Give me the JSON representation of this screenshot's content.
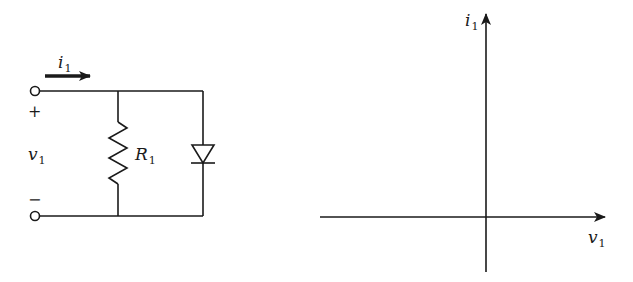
{
  "circuit": {
    "current_label": {
      "sym": "i",
      "sub": "1"
    },
    "voltage_label": {
      "sym": "v",
      "sub": "1"
    },
    "plus_sign": "+",
    "minus_sign": "−",
    "resistor_label": {
      "sym": "R",
      "sub": "1"
    },
    "components": [
      "input-terminal-top",
      "input-terminal-bottom",
      "resistor-R1",
      "diode"
    ]
  },
  "graph": {
    "y_axis_label": {
      "sym": "i",
      "sub": "1"
    },
    "x_axis_label": {
      "sym": "v",
      "sub": "1"
    }
  },
  "colors": {
    "ink": "#1a1a1a",
    "background": "#ffffff"
  }
}
